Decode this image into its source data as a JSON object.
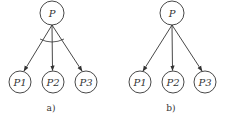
{
  "diagrams": [
    {
      "caption": "a)",
      "root": {
        "label": "P"
      },
      "children": [
        {
          "label": "P1"
        },
        {
          "label": "P2"
        },
        {
          "label": "P3"
        }
      ],
      "has_and_arc": true
    },
    {
      "caption": "b)",
      "root": {
        "label": "P"
      },
      "children": [
        {
          "label": "P1"
        },
        {
          "label": "P2"
        },
        {
          "label": "P3"
        }
      ],
      "has_and_arc": false
    }
  ],
  "colors": {
    "stroke": "#333333",
    "background": "#ffffff"
  }
}
